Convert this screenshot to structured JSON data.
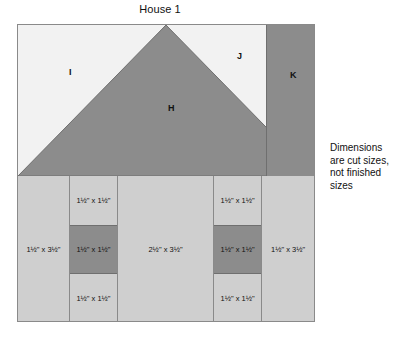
{
  "title": "House 1",
  "note": "Dimensions are cut sizes, not finished sizes",
  "colors": {
    "background": "#ffffff",
    "sky": "#f2f2f2",
    "roof": "#8c8c8c",
    "chimney": "#8c8c8c",
    "wall": "#cfcfcf",
    "window_pane": "#8c8c8c",
    "outline": "#8a8a8a",
    "text": "#111111"
  },
  "block": {
    "sky": {
      "left_patch_label": "I",
      "right_patch_label": "J"
    },
    "roof": {
      "label": "H"
    },
    "chimney": {
      "label": "K"
    },
    "wall": {
      "columns": [
        {
          "name": "left-wall-strip",
          "cells": [
            {
              "label": "1½\" x 3½\"",
              "shade": "wall"
            }
          ]
        },
        {
          "name": "left-window-column",
          "cells": [
            {
              "label": "1½\" x 1½\"",
              "shade": "wall"
            },
            {
              "label": "1½\" x 1½\"",
              "shade": "pane"
            },
            {
              "label": "1½\" x 1½\"",
              "shade": "wall"
            }
          ]
        },
        {
          "name": "door-column",
          "cells": [
            {
              "label": "2½\" x 3½\"",
              "shade": "wall"
            }
          ]
        },
        {
          "name": "right-window-column",
          "cells": [
            {
              "label": "1½\" x 1½\"",
              "shade": "wall"
            },
            {
              "label": "1½\" x 1½\"",
              "shade": "pane"
            },
            {
              "label": "1½\" x 1½\"",
              "shade": "wall"
            }
          ]
        },
        {
          "name": "right-wall-strip",
          "cells": [
            {
              "label": "1½\" x 3½\"",
              "shade": "wall"
            }
          ]
        }
      ]
    }
  }
}
